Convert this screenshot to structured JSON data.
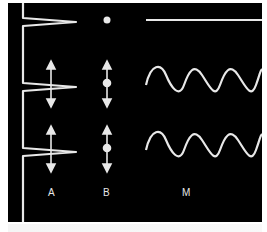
{
  "figure": {
    "background_color": "#000000",
    "stroke_color": "#e8e8e8",
    "columns": [
      {
        "id": "A",
        "label": "A",
        "rows": [
          "spike",
          "spike-with-double-arrow",
          "spike-with-double-arrow"
        ]
      },
      {
        "id": "B",
        "label": "B",
        "rows": [
          "dot",
          "dot-with-double-arrow",
          "dot-with-double-arrow"
        ]
      },
      {
        "id": "M",
        "label": "M",
        "rows": [
          "flat-line",
          "sine-wave",
          "sine-wave"
        ]
      }
    ],
    "caption": ""
  }
}
